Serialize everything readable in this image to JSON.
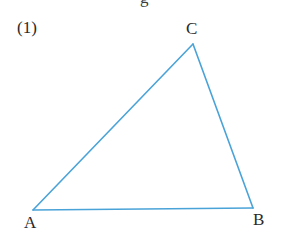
{
  "figure": {
    "top_text_fragment": "g",
    "label": "(1)",
    "stroke_color": "#4aa3d8",
    "vertices": {
      "A": {
        "label": "A",
        "x": 33,
        "y": 210
      },
      "B": {
        "label": "B",
        "x": 253,
        "y": 208
      },
      "C": {
        "label": "C",
        "x": 193,
        "y": 44
      }
    },
    "edges": [
      "AB",
      "BC",
      "CA"
    ]
  }
}
